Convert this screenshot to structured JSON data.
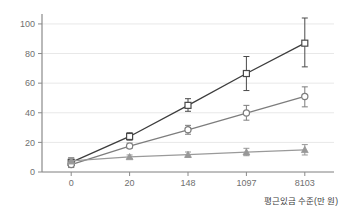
{
  "figure": {
    "clipped_title_text": "• • • • •",
    "background_color": "#ffffff",
    "grid_color": "#e8e8e8",
    "axis_color": "#8a8a8a"
  },
  "chart_data": {
    "type": "line",
    "title": "",
    "subtitle": "",
    "xlabel": "평원이타 중",
    "xlabel_text": "평근있금 수준(만 원)",
    "ylabel": "",
    "categories": [
      "0",
      "20",
      "148",
      "1097",
      "8103"
    ],
    "x": [
      0,
      20,
      148,
      1097,
      8103
    ],
    "xtick_labels": [
      "0",
      "20",
      "148",
      "1097",
      "8103"
    ],
    "ytick_labels": [
      "0",
      "20",
      "40",
      "60",
      "80",
      "100"
    ],
    "yticks": [
      0,
      20,
      40,
      60,
      80,
      100
    ],
    "ylim": [
      0,
      104
    ],
    "grid": true,
    "grid_axis": "y",
    "legend": false,
    "legend_position": "none",
    "error_bars": true,
    "error_bar_type": "95% CI",
    "series": [
      {
        "name": "series-square",
        "marker": "square",
        "color": "#4a4a4a",
        "line_color": "#3d3d3d",
        "values": [
          6.5,
          24.0,
          45.0,
          66.5,
          87.0
        ],
        "err_low": [
          3.5,
          21.5,
          41.0,
          55.0,
          71.0
        ],
        "err_high": [
          9.5,
          26.5,
          49.5,
          78.0,
          104.0
        ]
      },
      {
        "name": "series-circle",
        "marker": "circle",
        "color": "#7d7d7d",
        "line_color": "#7d7d7d",
        "values": [
          5.0,
          17.5,
          28.5,
          39.8,
          51.0
        ],
        "err_low": [
          3.0,
          16.0,
          25.5,
          35.0,
          44.0
        ],
        "err_high": [
          7.5,
          19.5,
          31.5,
          45.0,
          57.5
        ]
      },
      {
        "name": "series-triangle",
        "marker": "triangle",
        "color": "#989898",
        "line_color": "#9a9a9a",
        "values": [
          7.5,
          10.2,
          11.7,
          13.4,
          15.0
        ],
        "err_low": [
          5.5,
          9.0,
          10.0,
          11.0,
          11.5
        ],
        "err_high": [
          9.5,
          11.5,
          13.5,
          16.0,
          18.5
        ]
      }
    ]
  }
}
